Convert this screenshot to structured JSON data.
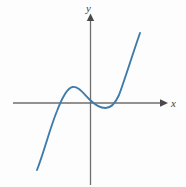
{
  "figure": {
    "background_color": "#fdfdfd",
    "width": 186,
    "height": 187
  },
  "axes": {
    "x_label": "x",
    "y_label": "y",
    "axis_color": "#6e6e6e",
    "arrow_color": "#4a4a4a",
    "x_axis_pixel_y": 103,
    "y_axis_pixel_x": 90,
    "x_axis_start_px": 13,
    "x_axis_end_px": 166,
    "y_axis_top_px": 15,
    "y_axis_bottom_px": 185
  },
  "curve": {
    "name": "cubic-curve",
    "color": "#3e7cab",
    "stroke_width": 1.9,
    "path": "M 37 170 C 44 152 50 128 57 111 C 62 98 67 88 72.5 87 C 78 86 83 93 89 99 C 95 105 100 108 105.5 108 C 111 108 115 104 119 95 C 124 82 130 62 140 33"
  },
  "chart_data": {
    "type": "line",
    "xlabel": "x",
    "ylabel": "y",
    "grid": false,
    "legend": null,
    "annotations": [],
    "axis_tick_labels": {
      "x": [],
      "y": []
    },
    "series": [
      {
        "name": "cubic",
        "color": "#3e7cab",
        "description": "Cubic curve rising from lower-left, local maximum above the x-axis left of the origin, passing near the origin, local minimum just below the x-axis right of the origin, then rising steeply to upper-right.",
        "features": {
          "local_maximum": {
            "x": -0.6,
            "y": 0.35
          },
          "local_minimum": {
            "x": 0.55,
            "y": -0.18
          },
          "x_intercepts": [
            -1.2,
            0.0,
            1.0
          ],
          "end_behavior_left": "decreasing to negative infinity",
          "end_behavior_right": "increasing to positive infinity"
        },
        "x": [
          -1.9,
          -1.7,
          -1.5,
          -1.3,
          -1.1,
          -0.9,
          -0.7,
          -0.5,
          -0.3,
          -0.1,
          0.1,
          0.3,
          0.5,
          0.7,
          0.9,
          1.1,
          1.3,
          1.5,
          1.7
        ],
        "y": [
          -3.55,
          -2.6,
          -1.8,
          -1.1,
          -0.52,
          -0.08,
          0.22,
          0.35,
          0.3,
          0.12,
          -0.08,
          -0.2,
          -0.22,
          -0.1,
          0.18,
          0.65,
          1.35,
          2.3,
          3.5
        ]
      }
    ],
    "xlim": [
      -2.1,
      2.1
    ],
    "ylim": [
      -4.1,
      4.1
    ]
  }
}
